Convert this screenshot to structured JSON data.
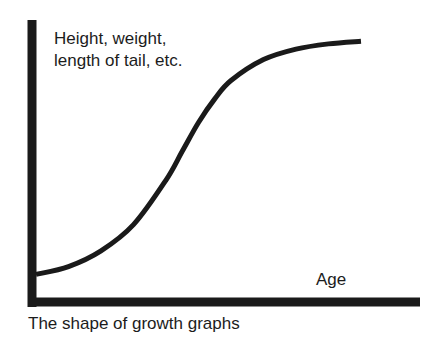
{
  "chart_data": {
    "type": "line",
    "title": "",
    "caption": "The shape of growth graphs",
    "xlabel": "Age",
    "ylabel_lines": [
      "Height, weight,",
      "length of tail, etc."
    ],
    "ticks": false,
    "grid": false,
    "legend": null,
    "xlim": [
      0,
      1
    ],
    "ylim": [
      0,
      1
    ],
    "series": [
      {
        "name": "growth curve (sigmoid)",
        "color": "#1a1a1a",
        "x": [
          0.0,
          0.1,
          0.2,
          0.3,
          0.4,
          0.45,
          0.5,
          0.55,
          0.6,
          0.7,
          0.8,
          0.9,
          1.0
        ],
        "y": [
          0.09,
          0.12,
          0.18,
          0.28,
          0.45,
          0.56,
          0.67,
          0.76,
          0.83,
          0.91,
          0.95,
          0.97,
          0.98
        ]
      }
    ]
  },
  "colors": {
    "ink": "#1a1a1a",
    "background": "#ffffff"
  }
}
